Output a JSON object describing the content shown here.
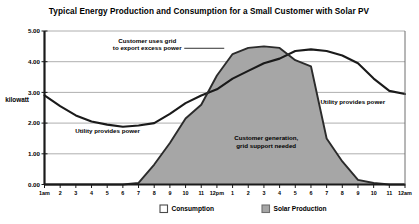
{
  "chart_data": {
    "type": "area",
    "title": "Typical Energy Production and Consumption for a Small Customer with Solar PV",
    "xlabel": "",
    "ylabel": "kilowatt",
    "ylim": [
      0,
      5
    ],
    "yticks": [
      "0.00",
      "1.00",
      "2.00",
      "3.00",
      "4.00",
      "5.00"
    ],
    "ytick_values": [
      0,
      1,
      2,
      3,
      4,
      5
    ],
    "grid": true,
    "legend_position": "bottom",
    "categories": [
      "1am",
      "2",
      "3",
      "4",
      "5",
      "6",
      "7",
      "8",
      "9",
      "10",
      "11",
      "12pm",
      "1",
      "2",
      "3",
      "4",
      "5",
      "6",
      "7",
      "8",
      "9",
      "10",
      "11",
      "12am"
    ],
    "series": [
      {
        "name": "Consumption",
        "type": "line",
        "color": "#1a1a1a",
        "fill": "none",
        "values": [
          2.9,
          2.55,
          2.25,
          2.05,
          1.95,
          1.88,
          1.92,
          2.0,
          2.3,
          2.65,
          2.9,
          3.1,
          3.45,
          3.7,
          3.95,
          4.1,
          4.35,
          4.4,
          4.35,
          4.2,
          3.95,
          3.45,
          3.05,
          2.95
        ]
      },
      {
        "name": "Solar Production",
        "type": "area",
        "color": "#9a9a9a",
        "fill": "#a6a6a6",
        "values": [
          0.0,
          0.0,
          0.0,
          0.0,
          0.0,
          0.0,
          0.05,
          0.65,
          1.35,
          2.15,
          2.6,
          3.55,
          4.25,
          4.45,
          4.5,
          4.45,
          4.05,
          3.85,
          1.5,
          0.75,
          0.15,
          0.05,
          0.0,
          0.0
        ]
      }
    ],
    "annotations": [
      {
        "text_lines": [
          "Customer uses grid",
          "to export excess power"
        ],
        "x": 0.285,
        "y": 4.62,
        "leader": true
      },
      {
        "text_lines": [
          "Utility provides power"
        ],
        "x": 0.175,
        "y": 1.68,
        "leader": false
      },
      {
        "text_lines": [
          "Customer generation,",
          "grid support needed"
        ],
        "x": 0.615,
        "y": 1.45,
        "leader": false
      },
      {
        "text_lines": [
          "Utility provides power"
        ],
        "x": 0.855,
        "y": 2.62,
        "leader": false
      }
    ]
  },
  "legend": {
    "items": [
      {
        "label": "Consumption",
        "swatch": "#ffffff",
        "border": "#4a4a4a"
      },
      {
        "label": "Solar Production",
        "swatch": "#a6a6a6",
        "border": "#6e6e6e"
      }
    ]
  }
}
